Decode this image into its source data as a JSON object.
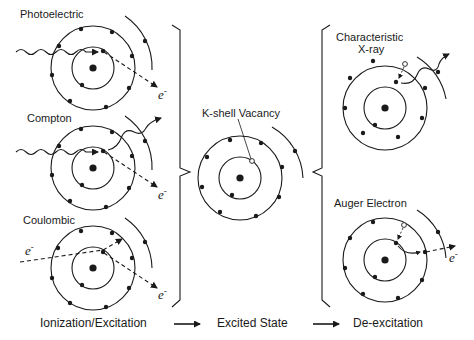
{
  "diagram": {
    "left_panel": {
      "panels": [
        {
          "label": "Photoelectric",
          "electron_out": "e",
          "charge": "-"
        },
        {
          "label": "Compton",
          "electron_out": "e",
          "charge": "-"
        },
        {
          "label": "Coulombic",
          "electron_in": "e",
          "electron_out": "e",
          "charge": "-"
        }
      ]
    },
    "middle_panel": {
      "label": "K-shell Vacancy"
    },
    "right_panel": {
      "panels": [
        {
          "label_line1": "Characteristic",
          "label_line2": "X-ray"
        },
        {
          "label": "Auger Electron",
          "electron_out": "e",
          "charge": "-"
        }
      ]
    },
    "footer": {
      "stage1": "Ionization/Excitation",
      "stage2": "Excited State",
      "stage3": "De-excitation"
    },
    "colors": {
      "line": "#1a1a1a",
      "background": "#ffffff"
    }
  }
}
